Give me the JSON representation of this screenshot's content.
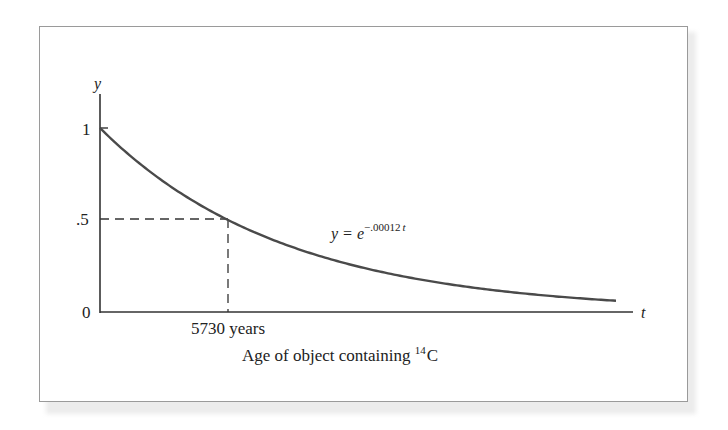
{
  "chart_data": {
    "type": "line",
    "title": "",
    "equation": "y = e^{-.00012t}",
    "xlabel": "Age of object containing 14C",
    "ylabel": "y",
    "x_axis_symbol": "t",
    "y_axis_symbol": "y",
    "ytick_labels": [
      "0",
      ".5",
      "1"
    ],
    "yticks": [
      0,
      0.5,
      1
    ],
    "xtick_labels": [
      "5730 years"
    ],
    "xticks": [
      5730
    ],
    "annotations": [
      {
        "type": "dashed",
        "from": [
          0,
          0.5
        ],
        "to": [
          5730,
          0.5
        ]
      },
      {
        "type": "dashed",
        "from": [
          5730,
          0.5
        ],
        "to": [
          5730,
          0
        ]
      }
    ],
    "series": [
      {
        "name": "y = e^{-.00012t}",
        "x": [
          0,
          2865,
          5730,
          8595,
          11460,
          14325,
          17190,
          20055,
          22920,
          25000
        ],
        "values": [
          1.0,
          0.709,
          0.503,
          0.357,
          0.253,
          0.179,
          0.127,
          0.09,
          0.064,
          0.05
        ]
      }
    ],
    "xlim": [
      0,
      27000
    ],
    "ylim": [
      0,
      1.15
    ],
    "grid": false,
    "legend": "none"
  },
  "labels": {
    "y_axis": "y",
    "t_axis": "t",
    "tick_1": "1",
    "tick_half": ".5",
    "tick_0": "0",
    "half_life": "5730 years",
    "eq_lhs": "y = ",
    "eq_base": "e",
    "eq_exp": "−.00012",
    "eq_exp_var": "t",
    "xlabel_main": "Age of object containing ",
    "xlabel_sup": "14",
    "xlabel_elem": "C"
  },
  "colors": {
    "curve": "#4a4a4a",
    "axis": "#333333",
    "frame": "#9a9a9a"
  }
}
